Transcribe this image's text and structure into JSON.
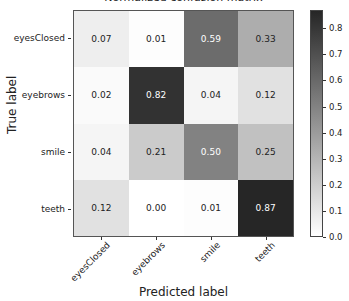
{
  "chart_data": {
    "type": "heatmap",
    "title": "Normalized confusion matrix",
    "xlabel": "Predicted label",
    "ylabel": "True label",
    "x_categories": [
      "eyesClosed",
      "eyebrows",
      "smile",
      "teeth"
    ],
    "y_categories": [
      "eyesClosed",
      "eyebrows",
      "smile",
      "teeth"
    ],
    "values": [
      [
        0.07,
        0.01,
        0.59,
        0.33
      ],
      [
        0.02,
        0.82,
        0.04,
        0.12
      ],
      [
        0.04,
        0.21,
        0.5,
        0.25
      ],
      [
        0.12,
        0.0,
        0.01,
        0.87
      ]
    ],
    "value_labels": [
      [
        "0.07",
        "0.01",
        "0.59",
        "0.33"
      ],
      [
        "0.02",
        "0.82",
        "0.04",
        "0.12"
      ],
      [
        "0.04",
        "0.21",
        "0.50",
        "0.25"
      ],
      [
        "0.12",
        "0.00",
        "0.01",
        "0.87"
      ]
    ],
    "colormap": "Greys",
    "colorbar": {
      "min": 0.0,
      "max": 0.87,
      "ticks": [
        "0.0",
        "0.1",
        "0.2",
        "0.3",
        "0.4",
        "0.5",
        "0.6",
        "0.7",
        "0.8"
      ]
    },
    "xtick_rotation": 45,
    "grid": false
  }
}
